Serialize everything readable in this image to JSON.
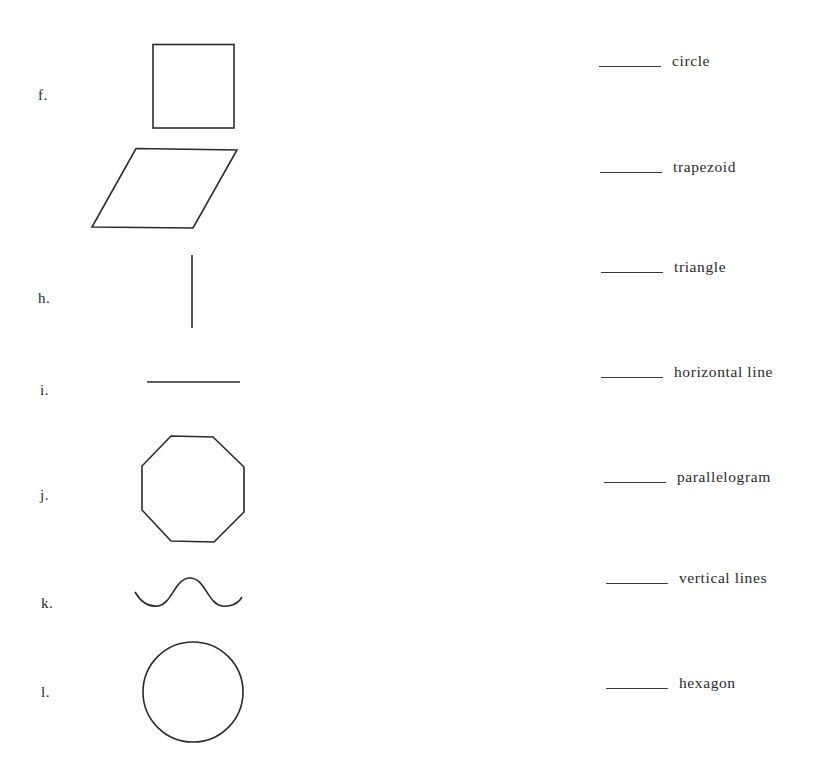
{
  "left_column": {
    "items": [
      {
        "letter": "f.",
        "shape": "square"
      },
      {
        "letter": "",
        "shape": "parallelogram"
      },
      {
        "letter": "h.",
        "shape": "vertical-line"
      },
      {
        "letter": "i.",
        "shape": "horizontal-line"
      },
      {
        "letter": "j.",
        "shape": "octagon"
      },
      {
        "letter": "k.",
        "shape": "wavy-curve"
      },
      {
        "letter": "l.",
        "shape": "circle"
      }
    ]
  },
  "right_column": {
    "answers": [
      {
        "blank": "",
        "term": "circle"
      },
      {
        "blank": "",
        "term": "trapezoid"
      },
      {
        "blank": "",
        "term": "triangle"
      },
      {
        "blank": "",
        "term": "horizontal line"
      },
      {
        "blank": "",
        "term": "parallelogram"
      },
      {
        "blank": "",
        "term": "vertical lines"
      },
      {
        "blank": "",
        "term": "hexagon"
      }
    ]
  },
  "colors": {
    "ink": "#2b2b2b",
    "background": "#ffffff"
  }
}
